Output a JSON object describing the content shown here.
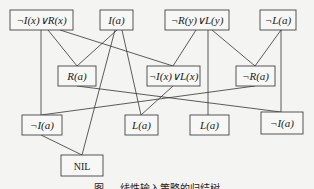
{
  "diagram": {
    "type": "resolution-tree",
    "nodes": [
      {
        "id": "n1",
        "label": "¬I(x)∨R(x)",
        "x": 10,
        "y": 10,
        "w": 63,
        "h": 20
      },
      {
        "id": "n2",
        "label": "I(a)",
        "x": 100,
        "y": 10,
        "w": 33,
        "h": 20
      },
      {
        "id": "n3",
        "label": "¬R(y)∨L(y)",
        "x": 165,
        "y": 10,
        "w": 64,
        "h": 20
      },
      {
        "id": "n4",
        "label": "¬L(a)",
        "x": 260,
        "y": 10,
        "w": 36,
        "h": 20
      },
      {
        "id": "n5",
        "label": "R(a)",
        "x": 58,
        "y": 66,
        "w": 38,
        "h": 20
      },
      {
        "id": "n6",
        "label": "¬I(x)∨L(x)",
        "x": 147,
        "y": 66,
        "w": 53,
        "h": 20
      },
      {
        "id": "n7",
        "label": "¬R(a)",
        "x": 236,
        "y": 66,
        "w": 39,
        "h": 20
      },
      {
        "id": "n8",
        "label": "¬I(a)",
        "x": 22,
        "y": 115,
        "w": 40,
        "h": 20
      },
      {
        "id": "n9",
        "label": "L(a)",
        "x": 125,
        "y": 115,
        "w": 33,
        "h": 20
      },
      {
        "id": "n10",
        "label": "L(a)",
        "x": 190,
        "y": 115,
        "w": 39,
        "h": 20
      },
      {
        "id": "n11",
        "label": "¬I(a)",
        "x": 261,
        "y": 112,
        "w": 42,
        "h": 22
      },
      {
        "id": "n12",
        "label": "NIL",
        "x": 61,
        "y": 155,
        "w": 42,
        "h": 21
      }
    ],
    "edges": [
      [
        48,
        30,
        77,
        66
      ],
      [
        117,
        30,
        77,
        66
      ],
      [
        60,
        30,
        173,
        66
      ],
      [
        196,
        30,
        173,
        66
      ],
      [
        212,
        30,
        255,
        66
      ],
      [
        281,
        30,
        255,
        66
      ],
      [
        41,
        30,
        41,
        115
      ],
      [
        115,
        30,
        82,
        155
      ],
      [
        122,
        30,
        141,
        115
      ],
      [
        77,
        86,
        281,
        112
      ],
      [
        208,
        30,
        208,
        115
      ],
      [
        173,
        86,
        141,
        115
      ],
      [
        255,
        86,
        41,
        115
      ],
      [
        281,
        30,
        281,
        112
      ],
      [
        41,
        135,
        82,
        155
      ]
    ]
  },
  "caption": "图 — 线性输入策略的归结树"
}
